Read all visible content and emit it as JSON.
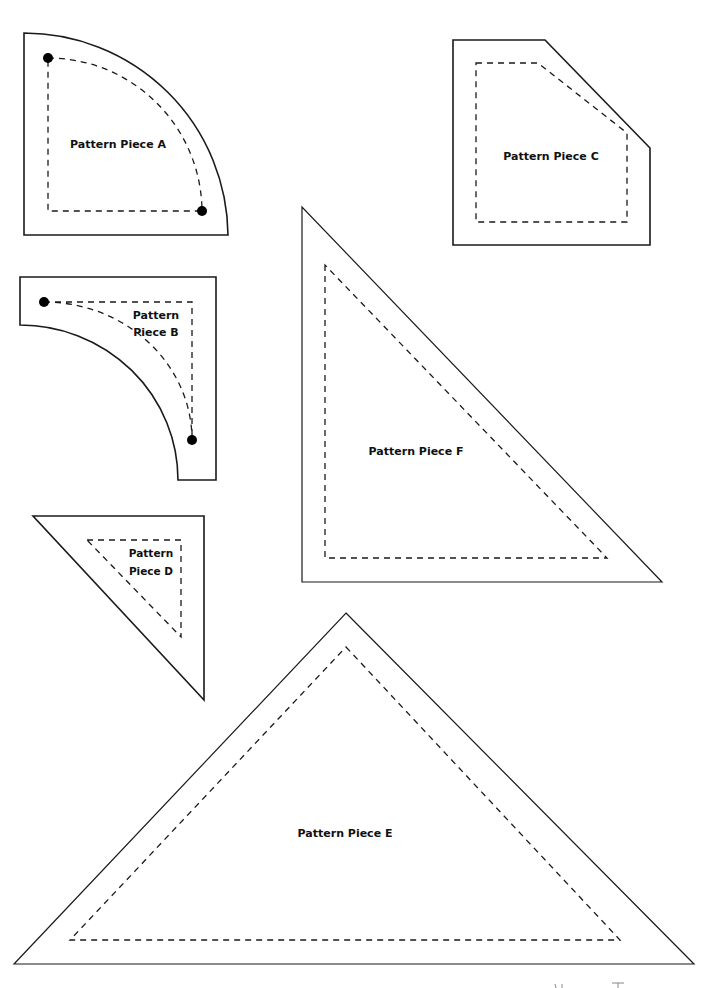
{
  "sheet": {
    "type": "quilt pattern template sheet",
    "line_legend": {
      "solid": "cutting line",
      "dashed": "sewing line",
      "dot": "matching point"
    }
  },
  "pieces": {
    "A": {
      "label": "Pattern Piece A",
      "shape": "quarter circle",
      "dots": 2
    },
    "B": {
      "label_line1": "Pattern",
      "label_line2": "Piece B",
      "shape": "concave quarter circle corner",
      "dots": 2
    },
    "C": {
      "label": "Pattern Piece C",
      "shape": "pentagon (square with clipped corner)"
    },
    "D": {
      "label_line1": "Pattern",
      "label_line2": "Piece D",
      "shape": "right triangle (small)"
    },
    "E": {
      "label": "Pattern Piece E",
      "shape": "triangle (large, isosceles)"
    },
    "F": {
      "label": "Pattern Piece F",
      "shape": "right triangle (large)"
    }
  },
  "colors": {
    "line": "#1a1a1a",
    "background": "#ffffff"
  }
}
